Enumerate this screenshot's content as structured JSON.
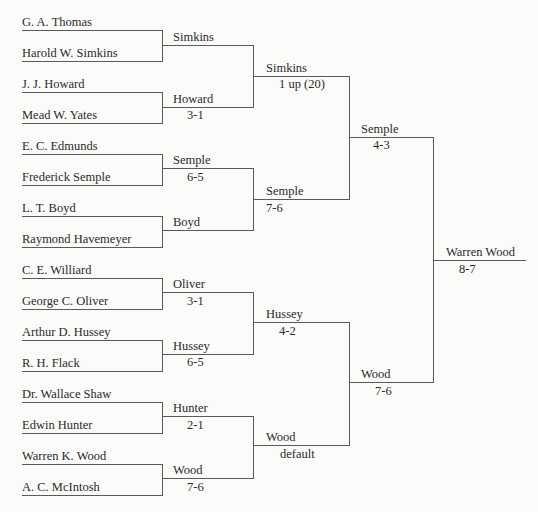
{
  "bracket": {
    "round1": [
      {
        "top": "G. A. Thomas",
        "bottom": "Harold W. Simkins",
        "winner": "Simkins",
        "score": ""
      },
      {
        "top": "J. J. Howard",
        "bottom": "Mead W. Yates",
        "winner": "Howard",
        "score": "3-1"
      },
      {
        "top": "E. C. Edmunds",
        "bottom": "Frederick Semple",
        "winner": "Semple",
        "score": "6-5"
      },
      {
        "top": "L. T. Boyd",
        "bottom": "Raymond Havemeyer",
        "winner": "Boyd",
        "score": ""
      },
      {
        "top": "C. E. Williard",
        "bottom": "George C. Oliver",
        "winner": "Oliver",
        "score": "3-1"
      },
      {
        "top": "Arthur D. Hussey",
        "bottom": "R. H. Flack",
        "winner": "Hussey",
        "score": "6-5"
      },
      {
        "top": "Dr. Wallace Shaw",
        "bottom": "Edwin Hunter",
        "winner": "Hunter",
        "score": "2-1"
      },
      {
        "top": "Warren K. Wood",
        "bottom": "A. C. McIntosh",
        "winner": "Wood",
        "score": "7-6"
      }
    ],
    "round2": [
      {
        "winner": "Simkins",
        "score": "1 up (20)"
      },
      {
        "winner": "Semple",
        "score": "7-6"
      },
      {
        "winner": "Hussey",
        "score": "4-2"
      },
      {
        "winner": "Wood",
        "score": "default"
      }
    ],
    "round3": [
      {
        "winner": "Semple",
        "score": "4-3"
      },
      {
        "winner": "Wood",
        "score": "7-6"
      }
    ],
    "final": {
      "winner": "Warren Wood",
      "score": "8-7"
    }
  }
}
